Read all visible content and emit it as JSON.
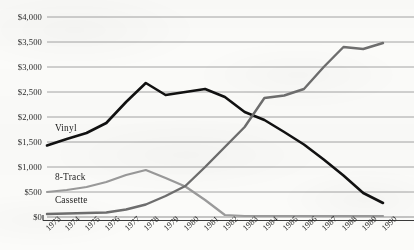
{
  "chart_data": {
    "type": "line",
    "title": "",
    "subtitle": "",
    "xlabel": "",
    "ylabel": "",
    "grid": true,
    "legend_position": "inline-labels",
    "x": [
      1973,
      1974,
      1975,
      1976,
      1977,
      1978,
      1979,
      1980,
      1981,
      1982,
      1983,
      1984,
      1985,
      1986,
      1987,
      1988,
      1989,
      1990
    ],
    "categories": [
      "1973",
      "1974",
      "1975",
      "1976",
      "1977",
      "1978",
      "1979",
      "1980",
      "1981",
      "1982",
      "1983",
      "1984",
      "1985",
      "1986",
      "1987",
      "1988",
      "1989",
      "1990"
    ],
    "ylim": [
      0,
      4000
    ],
    "xlim": [
      1973,
      1990
    ],
    "y_ticks": [
      0,
      500,
      1000,
      1500,
      2000,
      2500,
      3000,
      3500,
      4000
    ],
    "y_tick_labels": [
      "$0",
      "$500",
      "$1,000",
      "$1,500",
      "$2,000",
      "$2,500",
      "$3,000",
      "$3,500",
      "$4,000"
    ],
    "series": [
      {
        "name": "Vinyl",
        "color": "#111111",
        "width": 2.6,
        "values": [
          1430,
          1560,
          1680,
          1880,
          2300,
          2680,
          2440,
          2500,
          2560,
          2400,
          2100,
          1940,
          1700,
          1450,
          1150,
          830,
          480,
          280
        ]
      },
      {
        "name": "8-Track",
        "color": "#9a9a9a",
        "width": 2.2,
        "values": [
          500,
          540,
          600,
          700,
          840,
          940,
          780,
          610,
          340,
          40,
          20,
          20,
          20,
          20,
          20,
          20,
          20,
          20
        ]
      },
      {
        "name": "Cassette",
        "color": "#6e6e6e",
        "width": 2.4,
        "values": [
          60,
          70,
          80,
          90,
          150,
          250,
          420,
          620,
          1000,
          1400,
          1800,
          2380,
          2430,
          2560,
          3000,
          3400,
          3360,
          3480
        ]
      }
    ],
    "annotations": [
      {
        "text": "Vinyl",
        "x": 1973.4,
        "y": 1760
      },
      {
        "text": "8-Track",
        "x": 1973.4,
        "y": 790
      },
      {
        "text": "Cassette",
        "x": 1973.4,
        "y": 330
      }
    ]
  },
  "axes": {
    "baseline_color": "#3a3a3a",
    "gridline_color": "#8f8f8f",
    "background": "#fbfbf9"
  }
}
